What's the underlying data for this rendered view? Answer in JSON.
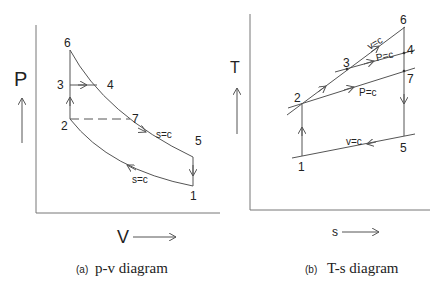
{
  "pv_diagram": {
    "caption_tag": "(a)",
    "caption_text": "p-v diagram",
    "y_axis_label": "P",
    "x_axis_label": "V",
    "points": {
      "1": "1",
      "2": "2",
      "3": "3",
      "4": "4",
      "5": "5",
      "6": "6",
      "7": "7"
    },
    "process_labels": {
      "expansion": "s=c",
      "compression": "s=c"
    }
  },
  "ts_diagram": {
    "caption_tag": "(b)",
    "caption_text": "T-s diagram",
    "y_axis_label": "T",
    "x_axis_label": "s",
    "points": {
      "1": "1",
      "2": "2",
      "3": "3",
      "4": "4",
      "5": "5",
      "6": "6",
      "7": "7"
    },
    "process_labels": {
      "v_upper": "v=c",
      "p_upper": "P=c",
      "p_lower": "P=c",
      "v_lower": "v=c"
    }
  }
}
